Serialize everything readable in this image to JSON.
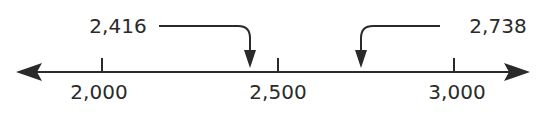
{
  "number_line": {
    "tick_labels": [
      "2,000",
      "2,500",
      "3,000"
    ],
    "tick_values": [
      2000,
      2500,
      3000
    ],
    "callouts": [
      {
        "label": "2,416",
        "value": 2416
      },
      {
        "label": "2,738",
        "value": 2738
      }
    ]
  },
  "colors": {
    "line": "#2a2a2a",
    "background": "#ffffff"
  }
}
